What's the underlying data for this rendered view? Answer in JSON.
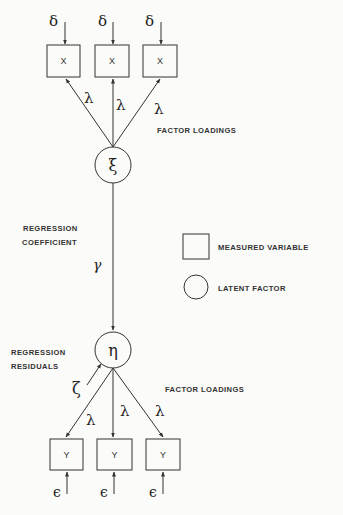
{
  "diagram": {
    "type": "structural-equation-model",
    "exogenous": {
      "factor_symbol": "ξ",
      "indicators": [
        {
          "label": "X",
          "error": "δ",
          "loading": "λ"
        },
        {
          "label": "X",
          "error": "δ",
          "loading": "λ"
        },
        {
          "label": "X",
          "error": "δ",
          "loading": "λ"
        }
      ],
      "loadings_label": "FACTOR LOADINGS"
    },
    "path": {
      "coefficient_symbol": "γ",
      "label_line1": "REGRESSION",
      "label_line2": "COEFFICIENT"
    },
    "endogenous": {
      "factor_symbol": "η",
      "residual_symbol": "ζ",
      "residual_label_line1": "REGRESSION",
      "residual_label_line2": "RESIDUALS",
      "indicators": [
        {
          "label": "Y",
          "error": "ϵ",
          "loading": "λ"
        },
        {
          "label": "Y",
          "error": "ϵ",
          "loading": "λ"
        },
        {
          "label": "Y",
          "error": "ϵ",
          "loading": "λ"
        }
      ],
      "loadings_label": "FACTOR LOADINGS"
    },
    "legend": {
      "measured": "MEASURED VARIABLE",
      "latent": "LATENT FACTOR"
    }
  }
}
